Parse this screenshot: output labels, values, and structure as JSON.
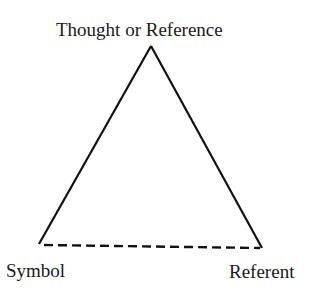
{
  "diagram": {
    "nodes": {
      "top": {
        "label": "Thought or Reference"
      },
      "left": {
        "label": "Symbol"
      },
      "right": {
        "label": "Referent"
      }
    },
    "edges": [
      {
        "from": "left",
        "to": "top",
        "style": "solid"
      },
      {
        "from": "top",
        "to": "right",
        "style": "solid"
      },
      {
        "from": "left",
        "to": "right",
        "style": "dashed"
      }
    ],
    "colors": {
      "line": "#111111",
      "text": "#1a1a1a",
      "background": "#ffffff"
    }
  }
}
